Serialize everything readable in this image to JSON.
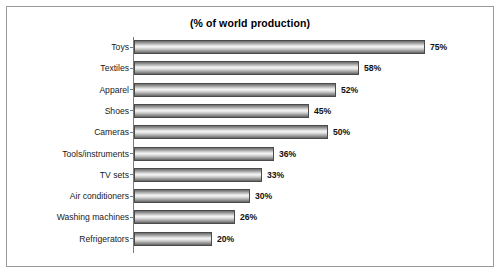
{
  "chart_data": {
    "type": "bar",
    "orientation": "horizontal",
    "title": "(% of world production)",
    "xlabel": "",
    "ylabel": "",
    "xlim": [
      0,
      75
    ],
    "grid": false,
    "legend": false,
    "value_suffix": "%",
    "categories": [
      "Toys",
      "Textiles",
      "Apparel",
      "Shoes",
      "Cameras",
      "Tools/instruments",
      "TV sets",
      "Air conditioners",
      "Washing machines",
      "Refrigerators"
    ],
    "values": [
      75,
      58,
      52,
      45,
      50,
      36,
      33,
      30,
      26,
      20
    ],
    "value_labels": [
      "75%",
      "58%",
      "52%",
      "45%",
      "50%",
      "36%",
      "33%",
      "30%",
      "26%",
      "20%"
    ],
    "colors": {
      "bar_outline": "#4a4a4a",
      "bar_fill_light": "#f4f4f4",
      "bar_fill_dark": "#636363",
      "axis": "#7b7b7b",
      "frame_border": "#9a9a9a",
      "background": "#ffffff",
      "text": "#111111"
    }
  }
}
